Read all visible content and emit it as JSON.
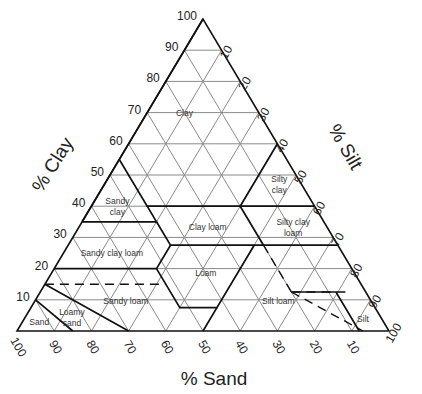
{
  "chart_data": {
    "type": "ternary",
    "title": "",
    "axes": {
      "clay": {
        "label": "% Clay",
        "ticks": [
          10,
          20,
          30,
          40,
          50,
          60,
          70,
          80,
          90,
          100
        ],
        "side": "left"
      },
      "silt": {
        "label": "% Silt",
        "ticks": [
          10,
          20,
          30,
          40,
          50,
          60,
          70,
          80,
          90,
          100
        ],
        "side": "right"
      },
      "sand": {
        "label": "% Sand",
        "ticks": [
          100,
          90,
          80,
          70,
          60,
          50,
          40,
          30,
          20,
          10
        ],
        "side": "bottom"
      }
    },
    "grid_step": 10,
    "grid": true,
    "classes": [
      {
        "name": "Clay",
        "lines": [
          "Clay"
        ],
        "label_at": {
          "sand": 20,
          "clay": 70
        }
      },
      {
        "name": "Sandy clay",
        "lines": [
          "Sandy",
          "clay"
        ],
        "label_at": {
          "sand": 53,
          "clay": 40
        }
      },
      {
        "name": "Silty clay",
        "lines": [
          "Silty",
          "clay"
        ],
        "label_at": {
          "sand": 6,
          "clay": 47
        }
      },
      {
        "name": "Clay loam",
        "lines": [
          "Clay loam"
        ],
        "label_at": {
          "sand": 32,
          "clay": 33.5
        }
      },
      {
        "name": "Silty clay loam",
        "lines": [
          "Silty clay",
          "loam"
        ],
        "label_at": {
          "sand": 9,
          "clay": 33.5
        }
      },
      {
        "name": "Sandy clay loam",
        "lines": [
          "Sandy clay loam"
        ],
        "label_at": {
          "sand": 62,
          "clay": 25
        }
      },
      {
        "name": "Loam",
        "lines": [
          "Loam"
        ],
        "label_at": {
          "sand": 40,
          "clay": 18.5
        }
      },
      {
        "name": "Sandy loam",
        "lines": [
          "Sandy loam"
        ],
        "label_at": {
          "sand": 66,
          "clay": 9.5
        }
      },
      {
        "name": "Silt loam",
        "lines": [
          "Silt loam"
        ],
        "label_at": {
          "sand": 25,
          "clay": 9.5
        }
      },
      {
        "name": "Loamy sand",
        "lines": [
          "Loamy",
          "sand"
        ],
        "label_at": {
          "sand": 83,
          "clay": 4.5
        }
      },
      {
        "name": "Sand",
        "lines": [
          "Sand"
        ],
        "label_at": {
          "sand": 92.5,
          "clay": 3
        }
      },
      {
        "name": "Silt",
        "lines": [
          "Silt"
        ],
        "label_at": {
          "sand": 5,
          "clay": 4
        }
      }
    ],
    "boundaries_sand_clay": [
      [
        [
          45,
          40
        ],
        [
          45,
          55
        ],
        [
          0,
          100
        ]
      ],
      [
        [
          45,
          55
        ],
        [
          65,
          35
        ]
      ],
      [
        [
          20,
          40
        ],
        [
          0,
          60
        ]
      ],
      [
        [
          65,
          35
        ],
        [
          45,
          35
        ],
        [
          45,
          40
        ],
        [
          20,
          40
        ],
        [
          0,
          40
        ]
      ],
      [
        [
          45,
          35
        ],
        [
          45,
          27.5
        ],
        [
          20,
          27.5
        ],
        [
          0,
          27.5
        ]
      ],
      [
        [
          20,
          40
        ],
        [
          20,
          27.5
        ]
      ],
      [
        [
          80,
          20
        ],
        [
          52.5,
          20
        ],
        [
          45,
          27.5
        ]
      ],
      [
        [
          52.5,
          20
        ],
        [
          52.5,
          7.5
        ],
        [
          42.5,
          7.5
        ],
        [
          22.5,
          27.5
        ]
      ],
      [
        [
          42.5,
          7.5
        ],
        [
          50,
          0
        ]
      ],
      [
        [
          85,
          15
        ],
        [
          70,
          0
        ]
      ],
      [
        [
          90,
          10
        ],
        [
          85,
          0
        ]
      ],
      [
        [
          20,
          12.5
        ],
        [
          8,
          12.5
        ],
        [
          8,
          0
        ]
      ]
    ],
    "dashed_boundaries_sand_clay": [
      [
        [
          85,
          15
        ],
        [
          52.5,
          15
        ]
      ],
      [
        [
          20,
          27.5
        ],
        [
          20,
          12.5
        ]
      ],
      [
        [
          20,
          12.5
        ],
        [
          5,
          12.5
        ]
      ],
      [
        [
          20,
          12.5
        ],
        [
          7,
          0
        ]
      ]
    ]
  }
}
